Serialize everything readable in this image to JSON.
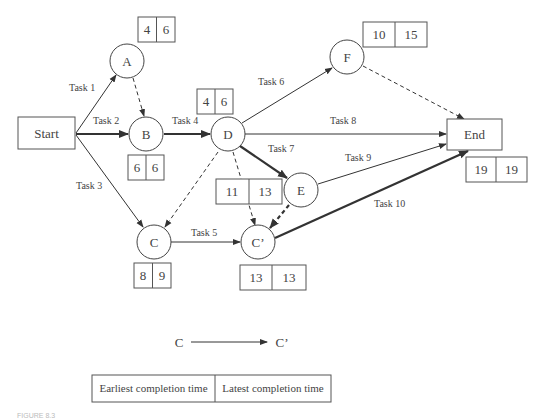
{
  "diagram": {
    "type": "network",
    "title": "",
    "nodes": [
      {
        "id": "start",
        "label": "Start",
        "shape": "rect"
      },
      {
        "id": "A",
        "label": "A",
        "shape": "circle",
        "earliest": "4",
        "latest": "6"
      },
      {
        "id": "B",
        "label": "B",
        "shape": "circle",
        "earliest": "6",
        "latest": "6"
      },
      {
        "id": "C",
        "label": "C",
        "shape": "circle",
        "earliest": "8",
        "latest": "9"
      },
      {
        "id": "D",
        "label": "D",
        "shape": "circle",
        "earliest": "4",
        "latest": "6"
      },
      {
        "id": "E",
        "label": "E",
        "shape": "circle",
        "earliest": "11",
        "latest": "13"
      },
      {
        "id": "F",
        "label": "F",
        "shape": "circle",
        "earliest": "10",
        "latest": "15"
      },
      {
        "id": "Cp",
        "label": "C’",
        "shape": "circle",
        "earliest": "13",
        "latest": "13"
      },
      {
        "id": "end",
        "label": "End",
        "shape": "rect",
        "earliest": "19",
        "latest": "19"
      }
    ],
    "edges": [
      {
        "from": "start",
        "to": "A",
        "label": "Task 1",
        "style": "solid"
      },
      {
        "from": "start",
        "to": "B",
        "label": "Task 2",
        "style": "bold"
      },
      {
        "from": "start",
        "to": "C",
        "label": "Task 3",
        "style": "solid"
      },
      {
        "from": "B",
        "to": "D",
        "label": "Task 4",
        "style": "bold"
      },
      {
        "from": "C",
        "to": "Cp",
        "label": "Task 5",
        "style": "solid"
      },
      {
        "from": "D",
        "to": "F",
        "label": "Task 6",
        "style": "solid"
      },
      {
        "from": "D",
        "to": "E",
        "label": "Task 7",
        "style": "bold"
      },
      {
        "from": "D",
        "to": "end",
        "label": "Task 8",
        "style": "solid"
      },
      {
        "from": "E",
        "to": "end",
        "label": "Task 9",
        "style": "solid"
      },
      {
        "from": "Cp",
        "to": "end",
        "label": "Task 10",
        "style": "bold"
      },
      {
        "from": "A",
        "to": "B",
        "label": "",
        "style": "dashed"
      },
      {
        "from": "D",
        "to": "C",
        "label": "",
        "style": "dashed"
      },
      {
        "from": "D",
        "to": "Cp",
        "label": "",
        "style": "dashed"
      },
      {
        "from": "E",
        "to": "Cp",
        "label": "",
        "style": "bold-dashed"
      },
      {
        "from": "F",
        "to": "end",
        "label": "",
        "style": "dashed"
      }
    ]
  },
  "legend": {
    "arrow_from": "C",
    "arrow_to": "C’",
    "col1": "Earliest completion time",
    "col2": "Latest completion time"
  },
  "caption": "FIGURE 8.3",
  "colors": {
    "line": "#333333",
    "box_border": "#555555",
    "text": "#444444"
  }
}
